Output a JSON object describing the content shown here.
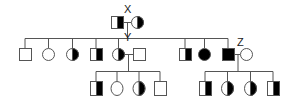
{
  "diagram": {
    "type": "pedigree",
    "labels": {
      "x": "X",
      "y": "Y",
      "z": "Z"
    },
    "colors": {
      "line": "#555555",
      "fill": "#000000",
      "background": "#ffffff"
    },
    "generation_1": [
      {
        "id": "x-father",
        "sex": "male",
        "affected": "right-half"
      },
      {
        "id": "x-mother",
        "sex": "female",
        "affected": "right-half"
      }
    ],
    "generation_2": [
      {
        "sex": "male",
        "affected": "none"
      },
      {
        "sex": "female",
        "affected": "none"
      },
      {
        "sex": "female",
        "affected": "right-half"
      },
      {
        "sex": "male",
        "affected": "right-half"
      },
      {
        "id": "y",
        "sex": "female",
        "affected": "right-half"
      },
      {
        "id": "y-spouse",
        "sex": "male",
        "affected": "none"
      },
      {
        "sex": "male",
        "affected": "right-half"
      },
      {
        "sex": "female",
        "affected": "full"
      },
      {
        "id": "z",
        "sex": "male",
        "affected": "full"
      },
      {
        "id": "z-spouse",
        "sex": "female",
        "affected": "none"
      }
    ],
    "generation_3_y_children": [
      {
        "sex": "male",
        "affected": "right-half"
      },
      {
        "sex": "female",
        "affected": "none"
      },
      {
        "sex": "female",
        "affected": "right-half"
      },
      {
        "sex": "male",
        "affected": "none"
      }
    ],
    "generation_3_z_children": [
      {
        "sex": "male",
        "affected": "right-half"
      },
      {
        "sex": "female",
        "affected": "right-half"
      },
      {
        "sex": "female",
        "affected": "right-half"
      },
      {
        "sex": "male",
        "affected": "right-half"
      }
    ]
  }
}
